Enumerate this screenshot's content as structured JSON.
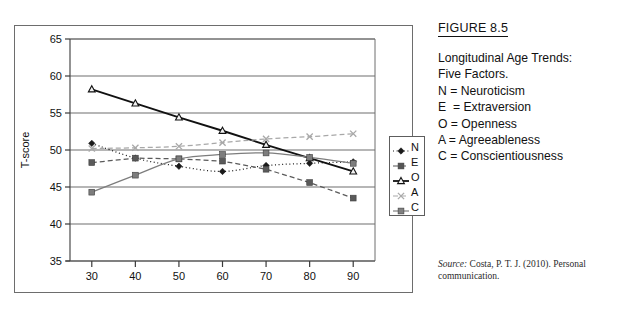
{
  "figure": {
    "number_label": "FIGURE 8.5",
    "caption_lines": [
      "Longitudinal Age Trends:",
      "Five Factors.",
      "N = Neuroticism",
      "E  = Extraversion",
      "O = Openness",
      "A = Agreeableness",
      "C = Conscientiousness"
    ],
    "source_prefix": "Source:",
    "source_text": " Costa, P. T. J. (2010). Personal communication."
  },
  "legend": {
    "items": [
      {
        "key": "N",
        "label": "N",
        "marker": "diamond",
        "dash": "dotted",
        "color": "#1a1a1a"
      },
      {
        "key": "E",
        "label": "E",
        "marker": "square",
        "dash": "dashed",
        "color": "#555555"
      },
      {
        "key": "O",
        "label": "O",
        "marker": "triangle",
        "dash": "solid",
        "color": "#111111"
      },
      {
        "key": "A",
        "label": "A",
        "marker": "cross",
        "dash": "dashed",
        "color": "#aaaaaa"
      },
      {
        "key": "C",
        "label": "C",
        "marker": "square",
        "dash": "solid",
        "color": "#808080"
      }
    ]
  },
  "chart_data": {
    "type": "line",
    "title": "",
    "xlabel": "Age",
    "ylabel": "T-score",
    "x": [
      30,
      40,
      50,
      60,
      70,
      80,
      90
    ],
    "categories": [
      "30",
      "40",
      "50",
      "60",
      "70",
      "80",
      "90"
    ],
    "xlim": [
      25,
      95
    ],
    "ylim": [
      35,
      65
    ],
    "yticks": [
      35,
      40,
      45,
      50,
      55,
      60,
      65
    ],
    "xticks": [
      30,
      40,
      50,
      60,
      70,
      80,
      90
    ],
    "grid": "horizontal",
    "legend_position": "right-inside",
    "series": [
      {
        "name": "N",
        "full_name": "Neuroticism",
        "marker": "diamond",
        "dash": "dotted",
        "color": "#1a1a1a",
        "values": [
          50.9,
          48.9,
          47.8,
          47.1,
          47.9,
          48.2,
          48.4
        ]
      },
      {
        "name": "E",
        "full_name": "Extraversion",
        "marker": "square",
        "dash": "dashed",
        "color": "#5a5a5a",
        "values": [
          48.3,
          48.9,
          48.8,
          48.5,
          47.4,
          45.6,
          43.5
        ]
      },
      {
        "name": "O",
        "full_name": "Openness",
        "marker": "triangle",
        "dash": "solid",
        "color": "#111111",
        "values": [
          58.2,
          56.3,
          54.4,
          52.6,
          50.7,
          48.9,
          47.1
        ]
      },
      {
        "name": "A",
        "full_name": "Agreeableness",
        "marker": "cross",
        "dash": "dashed",
        "color": "#a8a8a8",
        "values": [
          50.2,
          50.3,
          50.5,
          51.0,
          51.5,
          51.8,
          52.2
        ]
      },
      {
        "name": "C",
        "full_name": "Conscientiousness",
        "marker": "square",
        "dash": "solid",
        "color": "#7d7d7d",
        "values": [
          44.3,
          46.6,
          48.8,
          49.4,
          49.6,
          49.0,
          48.2
        ]
      }
    ]
  }
}
